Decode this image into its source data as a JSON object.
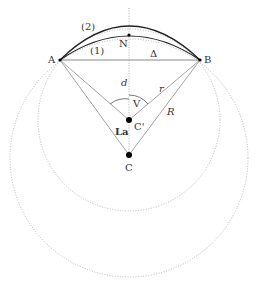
{
  "diagram": {
    "title": "",
    "points": {
      "A": {
        "label": "A",
        "x": 60,
        "y": 60
      },
      "B": {
        "label": "B",
        "x": 200,
        "y": 60
      },
      "N": {
        "label": "N",
        "x": 129,
        "y": 35
      },
      "C_prime": {
        "label": "C'",
        "x": 129,
        "y": 120
      },
      "C": {
        "label": "C",
        "x": 129,
        "y": 155
      }
    },
    "labels": {
      "arc_outer": "(2)",
      "arc_inner": "(1)",
      "chord": "Δ",
      "distance": "d",
      "angle_top": "V",
      "angle_left": "La",
      "radius_small": "r",
      "radius_large": "R"
    },
    "colors": {
      "line": "#888888",
      "arc": "#222222",
      "dotted": "#aaaaaa",
      "point": "#000000"
    }
  }
}
